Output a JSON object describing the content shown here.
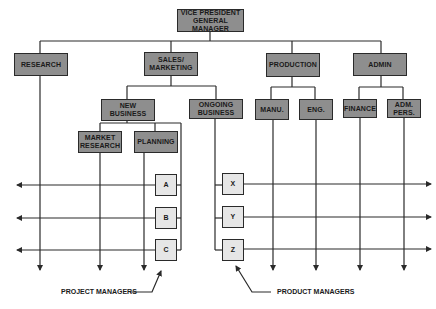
{
  "diagram": {
    "type": "matrix-org-chart",
    "colors": {
      "unit_box": "#8e8e8e",
      "manager_box": "#e6e6e6",
      "line": "#2a2a2a"
    },
    "top": {
      "label": "VICE PRESIDENT\nGENERAL\nMANAGER"
    },
    "divisions": [
      {
        "label": "RESEARCH"
      },
      {
        "label": "SALES/\nMARKETING"
      },
      {
        "label": "PRODUCTION"
      },
      {
        "label": "ADMIN"
      }
    ],
    "sub_units": {
      "sales": [
        {
          "label": "NEW\nBUSINESS"
        },
        {
          "label": "ONGOING\nBUSINESS"
        }
      ],
      "production": [
        {
          "label": "MANU."
        },
        {
          "label": "ENG."
        }
      ],
      "admin": [
        {
          "label": "FINANCE"
        },
        {
          "label": "ADM.\nPERS."
        }
      ],
      "new_business": [
        {
          "label": "MARKET\nRESEARCH"
        },
        {
          "label": "PLANNING"
        }
      ]
    },
    "project_managers": [
      {
        "label": "A"
      },
      {
        "label": "B"
      },
      {
        "label": "C"
      }
    ],
    "product_managers": [
      {
        "label": "X"
      },
      {
        "label": "Y"
      },
      {
        "label": "Z"
      }
    ],
    "annotations": {
      "project": "PROJECT MANAGERS",
      "product": "PRODUCT MANAGERS"
    }
  }
}
